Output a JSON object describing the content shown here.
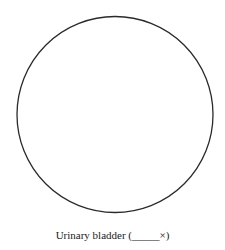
{
  "figure": {
    "circle": {
      "cx": 115,
      "cy": 114.5,
      "r": 98,
      "stroke": "#2a2a2a",
      "stroke_width": 1.3
    },
    "caption": {
      "label": "Urinary bladder (",
      "blank": "_____",
      "suffix": "×)"
    }
  }
}
